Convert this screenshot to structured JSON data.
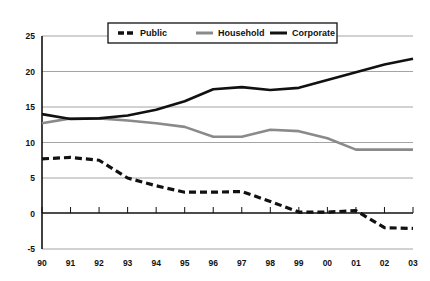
{
  "chart_data": {
    "type": "line",
    "title": "",
    "subtitle": "",
    "xlabel": "",
    "ylabel": "",
    "xlim": [
      0,
      13
    ],
    "ylim": [
      -5,
      25
    ],
    "yticks": [
      -5,
      0,
      5,
      10,
      15,
      20,
      25
    ],
    "ytick_labels": [
      "-5",
      "0",
      "5",
      "10",
      "15",
      "20",
      "25"
    ],
    "grid": true,
    "grid_axis": "y",
    "legend_position": "top-center",
    "categories": [
      "90",
      "91",
      "92",
      "93",
      "94",
      "95",
      "96",
      "97",
      "98",
      "99",
      "00",
      "01",
      "02",
      "03"
    ],
    "series": [
      {
        "name": "Public",
        "style": "dashed",
        "color": "#111111",
        "values": [
          7.7,
          7.9,
          7.5,
          5.0,
          3.9,
          3.0,
          3.0,
          3.1,
          1.7,
          0.2,
          0.2,
          0.4,
          -2.0,
          -2.1
        ]
      },
      {
        "name": "Household",
        "style": "solid",
        "color": "#8a8a8a",
        "values": [
          12.7,
          13.4,
          13.4,
          13.1,
          12.7,
          12.2,
          10.8,
          10.8,
          11.8,
          11.6,
          10.6,
          9.0,
          9.0,
          9.0
        ]
      },
      {
        "name": "Corporate",
        "style": "solid",
        "color": "#111111",
        "values": [
          14.0,
          13.3,
          13.4,
          13.8,
          14.6,
          15.8,
          17.5,
          17.8,
          17.4,
          17.7,
          18.8,
          19.9,
          21.0,
          21.8
        ]
      }
    ]
  },
  "legend": {
    "items": [
      {
        "label": "Public"
      },
      {
        "label": "Household"
      },
      {
        "label": "Corporate"
      }
    ]
  },
  "colors": {
    "axis": "#111111",
    "grid": "#9a9a9a",
    "public": "#111111",
    "household": "#8a8a8a",
    "corporate": "#111111",
    "background": "#ffffff"
  }
}
